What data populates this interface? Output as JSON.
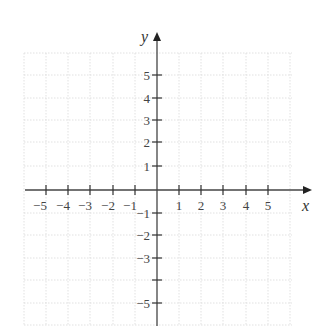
{
  "diagram": {
    "type": "cartesian-coordinate-plane",
    "x_axis": {
      "name": "x",
      "tick_labels": [
        "−5",
        "−4",
        "−3",
        "−2",
        "−1",
        "1",
        "2",
        "3",
        "4",
        "5"
      ]
    },
    "y_axis": {
      "name": "y",
      "tick_labels": [
        "5",
        "4",
        "3",
        "2",
        "1",
        "−1",
        "−2",
        "−3",
        "",
        "−5"
      ]
    },
    "grid": "light dotted",
    "colors": {
      "axis": "#444444",
      "grid": "#d9d9d9",
      "text": "#444444",
      "background": "#ffffff"
    }
  }
}
